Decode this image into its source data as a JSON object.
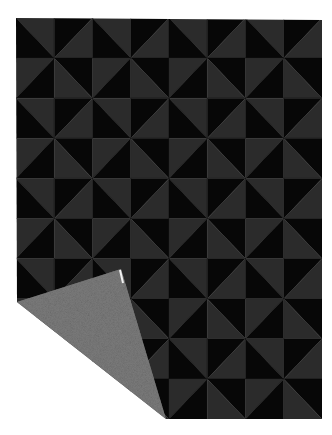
{
  "image": {
    "subject": "Folded pinwheel-pattern blanket",
    "width": 332,
    "height": 435,
    "background_color": "#ffffff"
  },
  "blanket": {
    "left": 16,
    "top": 18,
    "right": 322,
    "bottom": 419,
    "columns": 8,
    "rows": 10,
    "colors": {
      "dark": "#070707",
      "light": "#2b2b2b",
      "reverse_side": "#7c7c7c",
      "reverse_side_speckle": "#5e5e5e"
    },
    "block_pattern": {
      "description": "2x2 pinwheel block tiled 4x5",
      "cells": [
        {
          "pos": "top-left",
          "diagonal": "tl-br",
          "light_half": "upper-right"
        },
        {
          "pos": "top-right",
          "diagonal": "tr-bl",
          "light_half": "lower-right"
        },
        {
          "pos": "bottom-left",
          "diagonal": "tr-bl",
          "light_half": "upper-left"
        },
        {
          "pos": "bottom-right",
          "diagonal": "tl-br",
          "light_half": "lower-left"
        }
      ]
    },
    "folded_corner": {
      "crease_start": [
        17,
        302
      ],
      "tip": [
        121,
        269
      ],
      "crease_end": [
        166,
        419
      ],
      "tag_color": "#f2f2f2"
    }
  }
}
